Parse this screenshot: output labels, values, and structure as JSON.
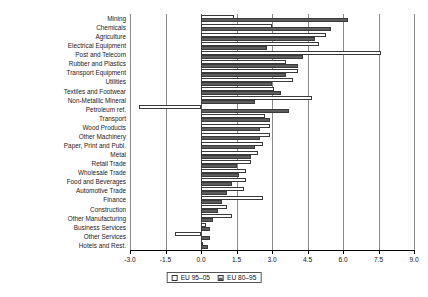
{
  "chart_data": {
    "type": "bar",
    "orientation": "horizontal",
    "title": "",
    "xlabel": "",
    "ylabel": "",
    "xlim": [
      -3.0,
      9.0
    ],
    "xticks": [
      "-3.0",
      "-1.5",
      "0.0",
      "1.5",
      "3.0",
      "4.5",
      "6.0",
      "7.5",
      "9.0"
    ],
    "xtick_values": [
      -3.0,
      -1.5,
      0.0,
      1.5,
      3.0,
      4.5,
      6.0,
      7.5,
      9.0
    ],
    "grid": true,
    "legend_position": "bottom-center",
    "categories": [
      "Mining",
      "Chemicals",
      "Agriculture",
      "Electrical Equipment",
      "Post and Telecom",
      "Rubber and  Plastics",
      "Transport Equipment",
      "Utilities",
      "Textiles and Footwear",
      "Non-Metallic Mineral",
      "Petroleum ref.",
      "Transport",
      "Wood Products",
      "Other Machinery",
      "Paper, Print and Publ.",
      "Metal",
      "Retail Trade",
      "Wholesale Trade",
      "Food and Beverages",
      "Automotive Trade",
      "Finance",
      "Construction",
      "Other Manufacturing",
      "Business Services",
      "Other Services",
      "Hotels and Rest."
    ],
    "series": [
      {
        "name": "EU 95-05",
        "values": [
          1.4,
          3.0,
          5.3,
          5.0,
          7.6,
          3.6,
          4.1,
          3.9,
          3.1,
          4.7,
          -2.6,
          2.7,
          2.9,
          2.9,
          2.6,
          2.4,
          2.1,
          1.9,
          1.9,
          1.8,
          2.6,
          1.1,
          1.3,
          0.2,
          -1.1,
          0.1
        ]
      },
      {
        "name": "EU 80-95",
        "values": [
          6.2,
          5.5,
          4.8,
          2.8,
          4.3,
          4.1,
          3.6,
          3.0,
          3.4,
          2.3,
          3.7,
          2.9,
          2.5,
          2.5,
          2.3,
          2.1,
          1.5,
          1.6,
          1.3,
          1.1,
          0.9,
          0.7,
          0.5,
          0.4,
          0.4,
          0.3
        ]
      }
    ],
    "legend": [
      {
        "label": "EU 95–05",
        "pattern": "open"
      },
      {
        "label": "EU 80–95",
        "pattern": "hatched"
      }
    ]
  },
  "colors": {
    "series_open_fill": "#ffffff",
    "series_hatch_dark": "#5d5d5d",
    "series_hatch_light": "#d8d8d8",
    "bar_outline": "#3a3a3a",
    "axis": "#000000",
    "grid": "#8a8a8a",
    "text": "#1a1a1a",
    "background": "#ffffff"
  }
}
